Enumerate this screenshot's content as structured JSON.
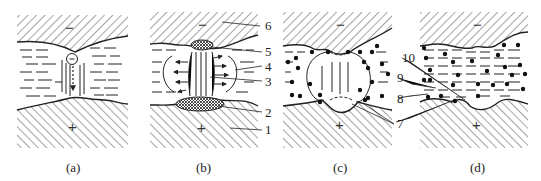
{
  "figure": {
    "panels": [
      {
        "id": "a",
        "caption": "(a)",
        "top_sign": "−",
        "bottom_sign": "+"
      },
      {
        "id": "b",
        "caption": "(b)",
        "top_sign": "−",
        "bottom_sign": "+"
      },
      {
        "id": "c",
        "caption": "(c)",
        "top_sign": "−",
        "bottom_sign": "+"
      },
      {
        "id": "d",
        "caption": "(d)",
        "top_sign": "−",
        "bottom_sign": "+"
      }
    ],
    "callouts_b": [
      "6",
      "5",
      "4",
      "3",
      "2",
      "1"
    ],
    "callouts_cd": [
      "10",
      "9",
      "8",
      "7"
    ],
    "colors": {
      "line": "#222222",
      "background": "#ffffff"
    }
  }
}
